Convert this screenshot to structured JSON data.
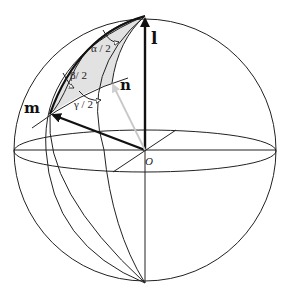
{
  "diagram": {
    "type": "unit-sphere-rotation-geometry",
    "labels": {
      "l": "l",
      "m": "m",
      "n": "n",
      "origin": "O",
      "alpha_half": "α / 2",
      "beta_half": "β/ 2",
      "gamma_half": "γ / 2"
    },
    "vectors": [
      {
        "name": "l",
        "from": "O",
        "to": "north-pole",
        "style": "thick-black"
      },
      {
        "name": "m",
        "from": "O",
        "to": "m-point",
        "style": "thick-black"
      },
      {
        "name": "n",
        "from": "O",
        "to": "n-point",
        "style": "gray"
      }
    ],
    "shaded_region": "spherical-triangle l-m-n",
    "colors": {
      "stroke": "#222222",
      "thick_vector": "#111111",
      "n_vector": "#c8c8c8",
      "shade": "#e2e2e2",
      "background": "#ffffff"
    }
  }
}
